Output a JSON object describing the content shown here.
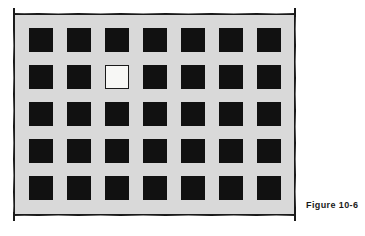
{
  "figure": {
    "caption": "Figure 10-6",
    "panel": {
      "background_color": "#d9d9d9",
      "border_color": "#1a1a1a",
      "border_style": "hand-drawn"
    },
    "grid": {
      "columns": 7,
      "rows": 5,
      "total_cells": 35,
      "square_color": "#111111",
      "inverted_square_color": "#f7f7f5",
      "inverted_cell": {
        "row": 2,
        "column": 3
      },
      "cells": [
        [
          {
            "state": "filled",
            "row": 1,
            "column": 1
          },
          {
            "state": "filled",
            "row": 1,
            "column": 2
          },
          {
            "state": "filled",
            "row": 1,
            "column": 3
          },
          {
            "state": "filled",
            "row": 1,
            "column": 4
          },
          {
            "state": "filled",
            "row": 1,
            "column": 5
          },
          {
            "state": "filled",
            "row": 1,
            "column": 6
          },
          {
            "state": "filled",
            "row": 1,
            "column": 7
          }
        ],
        [
          {
            "state": "filled",
            "row": 2,
            "column": 1
          },
          {
            "state": "filled",
            "row": 2,
            "column": 2
          },
          {
            "state": "inverted",
            "row": 2,
            "column": 3
          },
          {
            "state": "filled",
            "row": 2,
            "column": 4
          },
          {
            "state": "filled",
            "row": 2,
            "column": 5
          },
          {
            "state": "filled",
            "row": 2,
            "column": 6
          },
          {
            "state": "filled",
            "row": 2,
            "column": 7
          }
        ],
        [
          {
            "state": "filled",
            "row": 3,
            "column": 1
          },
          {
            "state": "filled",
            "row": 3,
            "column": 2
          },
          {
            "state": "filled",
            "row": 3,
            "column": 3
          },
          {
            "state": "filled",
            "row": 3,
            "column": 4
          },
          {
            "state": "filled",
            "row": 3,
            "column": 5
          },
          {
            "state": "filled",
            "row": 3,
            "column": 6
          },
          {
            "state": "filled",
            "row": 3,
            "column": 7
          }
        ],
        [
          {
            "state": "filled",
            "row": 4,
            "column": 1
          },
          {
            "state": "filled",
            "row": 4,
            "column": 2
          },
          {
            "state": "filled",
            "row": 4,
            "column": 3
          },
          {
            "state": "filled",
            "row": 4,
            "column": 4
          },
          {
            "state": "filled",
            "row": 4,
            "column": 5
          },
          {
            "state": "filled",
            "row": 4,
            "column": 6
          },
          {
            "state": "filled",
            "row": 4,
            "column": 7
          }
        ],
        [
          {
            "state": "filled",
            "row": 5,
            "column": 1
          },
          {
            "state": "filled",
            "row": 5,
            "column": 2
          },
          {
            "state": "filled",
            "row": 5,
            "column": 3
          },
          {
            "state": "filled",
            "row": 5,
            "column": 4
          },
          {
            "state": "filled",
            "row": 5,
            "column": 5
          },
          {
            "state": "filled",
            "row": 5,
            "column": 6
          },
          {
            "state": "filled",
            "row": 5,
            "column": 7
          }
        ]
      ]
    }
  }
}
